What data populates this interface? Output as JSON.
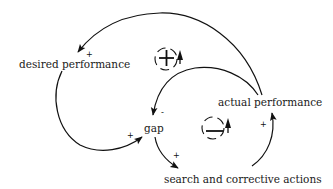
{
  "diagram": {
    "type": "causal-loop-diagram",
    "nodes": {
      "desired_performance": "desired performance",
      "actual_performance": "actual performance",
      "gap": "gap",
      "search_actions": "search and corrective actions"
    },
    "links": [
      {
        "from": "actual performance",
        "to": "desired performance",
        "polarity": "+"
      },
      {
        "from": "desired performance",
        "to": "gap",
        "polarity": "+"
      },
      {
        "from": "actual performance",
        "to": "gap",
        "polarity": "-"
      },
      {
        "from": "gap",
        "to": "search and corrective actions",
        "polarity": "+"
      },
      {
        "from": "search and corrective actions",
        "to": "actual performance",
        "polarity": "+"
      }
    ],
    "loops": [
      {
        "name": "reinforcing-loop",
        "sign": "+",
        "direction": "counterclockwise"
      },
      {
        "name": "balancing-loop",
        "sign": "-",
        "direction": "counterclockwise"
      }
    ],
    "polarity_labels": {
      "actual_to_desired": "+",
      "desired_to_gap": "+",
      "actual_to_gap": "-",
      "gap_to_search": "+",
      "search_to_actual": "+"
    }
  }
}
